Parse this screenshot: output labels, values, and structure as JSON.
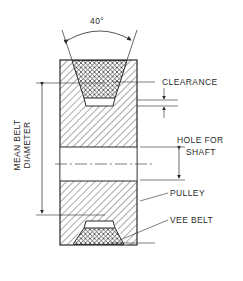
{
  "diagram": {
    "angle_label": "40°",
    "labels": {
      "clearance": "CLEARANCE",
      "hole_for": "HOLE FOR",
      "shaft": "SHAFT",
      "pulley": "PULLEY",
      "vee_belt": "VEE BELT",
      "mean_belt": "MEAN BELT",
      "diameter": "DIAMETER"
    },
    "colors": {
      "line": "#2a2a2a",
      "background": "#ffffff"
    }
  }
}
